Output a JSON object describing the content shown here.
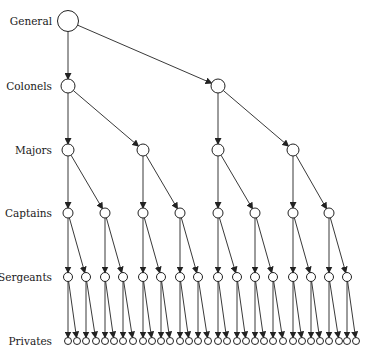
{
  "diagram": {
    "stroke_color": "#222222",
    "node_fill": "#ffffff",
    "levels": [
      {
        "label": "General",
        "y": 21,
        "r": 10.5,
        "xs": [
          68
        ]
      },
      {
        "label": "Colonels",
        "y": 86,
        "r": 7,
        "xs": [
          68,
          218
        ]
      },
      {
        "label": "Majors",
        "y": 150,
        "r": 6,
        "xs": [
          68,
          143,
          218,
          293
        ]
      },
      {
        "label": "Captains",
        "y": 213,
        "r": 5,
        "xs": [
          68,
          105,
          143,
          180,
          218,
          255,
          293,
          329
        ]
      },
      {
        "label": "Sergeants",
        "y": 277,
        "r": 4.5,
        "xs": [
          68,
          86,
          105,
          123,
          143,
          161,
          180,
          198,
          218,
          237,
          255,
          273,
          293,
          311,
          329,
          347
        ]
      },
      {
        "label": "Privates",
        "y": 341,
        "r": 3.5,
        "xs": [
          68,
          77,
          86,
          96,
          105,
          114,
          123,
          133,
          143,
          152,
          161,
          170,
          180,
          189,
          198,
          208,
          218,
          227,
          237,
          246,
          255,
          264,
          273,
          283,
          293,
          302,
          311,
          320,
          329,
          339,
          347,
          356
        ]
      }
    ]
  }
}
